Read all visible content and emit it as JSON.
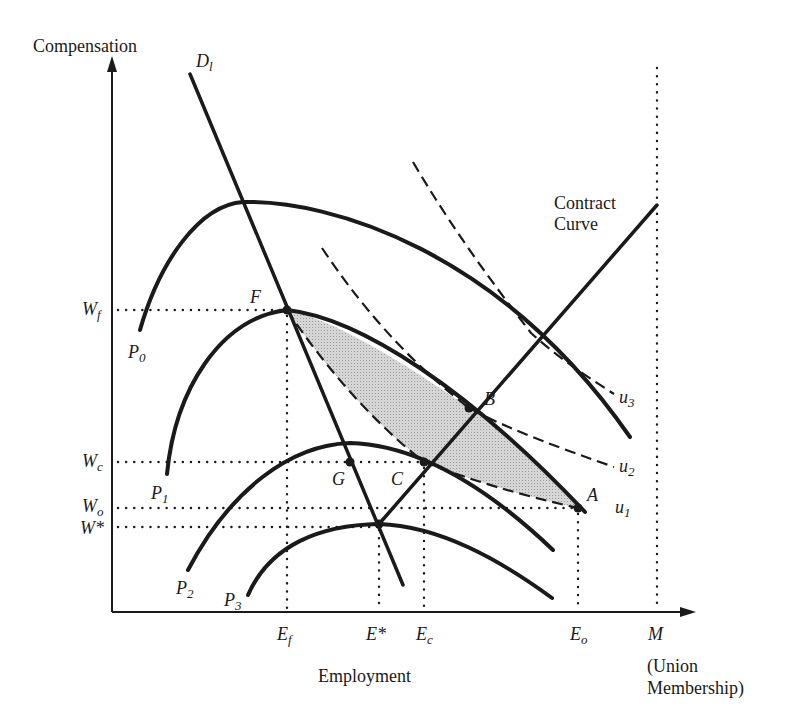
{
  "axes": {
    "y_label": "Compensation",
    "x_label": "Employment",
    "x_extra_label_line1": "(Union",
    "x_extra_label_line2": "Membership)"
  },
  "wage_labels": {
    "wf": {
      "base": "W",
      "sub": "f"
    },
    "wc": {
      "base": "W",
      "sub": "c"
    },
    "wo": {
      "base": "W",
      "sub": "o"
    },
    "wstar": {
      "base": "W*",
      "sub": ""
    }
  },
  "employment_labels": {
    "ef": {
      "base": "E",
      "sub": "f"
    },
    "estar": {
      "base": "E*",
      "sub": ""
    },
    "ec": {
      "base": "E",
      "sub": "c"
    },
    "eo": {
      "base": "E",
      "sub": "o"
    },
    "m": {
      "base": "M",
      "sub": ""
    }
  },
  "curve_labels": {
    "demand": {
      "base": "D",
      "sub": "l"
    },
    "p0": {
      "base": "P",
      "sub": "0"
    },
    "p1": {
      "base": "P",
      "sub": "1"
    },
    "p2": {
      "base": "P",
      "sub": "2"
    },
    "p3": {
      "base": "P",
      "sub": "3"
    },
    "u1": {
      "base": "u",
      "sub": "1"
    },
    "u2": {
      "base": "u",
      "sub": "2"
    },
    "u3": {
      "base": "u",
      "sub": "3"
    },
    "contract_line1": "Contract",
    "contract_line2": "Curve"
  },
  "points": {
    "a": "A",
    "b": "B",
    "c": "C",
    "f": "F",
    "g": "G"
  },
  "colors": {
    "ink": "#1a1a1a",
    "shade": "#c8c8c8"
  }
}
